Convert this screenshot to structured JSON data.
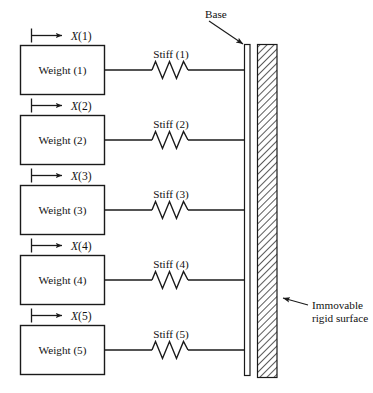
{
  "diagram": {
    "colors": {
      "line": "#1a1a1a",
      "background": "#ffffff",
      "hatch": "#5a5a5a",
      "box_fill": "#ffffff"
    },
    "units": [
      {
        "weight_label": "Weight (1)",
        "stiff_label": "Stiff (1)",
        "displacement_var": "X",
        "displacement_index": "(1)",
        "displacement_label": "X(1)"
      },
      {
        "weight_label": "Weight (2)",
        "stiff_label": "Stiff (2)",
        "displacement_var": "X",
        "displacement_index": "(2)",
        "displacement_label": "X(2)"
      },
      {
        "weight_label": "Weight (3)",
        "stiff_label": "Stiff (3)",
        "displacement_var": "X",
        "displacement_index": "(3)",
        "displacement_label": "X(3)"
      },
      {
        "weight_label": "Weight (4)",
        "stiff_label": "Stiff (4)",
        "displacement_var": "X",
        "displacement_index": "(4)",
        "displacement_label": "X(4)"
      },
      {
        "weight_label": "Weight (5)",
        "stiff_label": "Stiff (5)",
        "displacement_var": "X",
        "displacement_index": "(5)",
        "displacement_label": "X(5)"
      }
    ],
    "callouts": {
      "base": "Base",
      "surface_line1": "Immovable",
      "surface_line2": "rigid surface"
    }
  }
}
